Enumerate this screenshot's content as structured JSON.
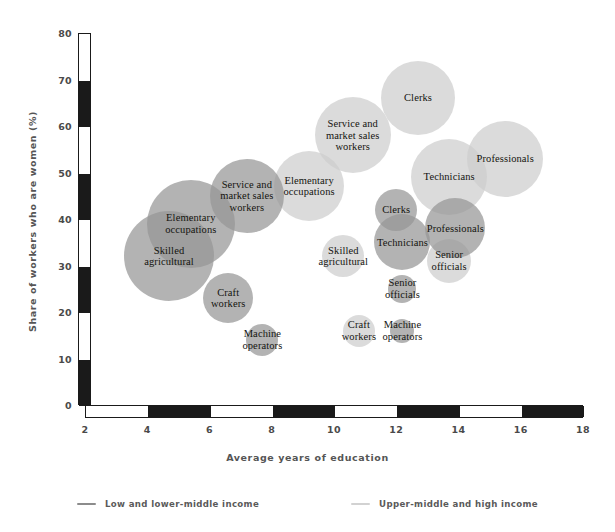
{
  "chart_data": {
    "type": "scatter",
    "title": "",
    "xlabel": "Average years of education",
    "ylabel": "Share of workers who are women (%)",
    "xlim": [
      2,
      18
    ],
    "ylim": [
      0,
      80
    ],
    "xticks": [
      2,
      4,
      6,
      8,
      10,
      12,
      14,
      16,
      18
    ],
    "yticks": [
      0,
      10,
      20,
      30,
      40,
      50,
      60,
      70,
      80
    ],
    "grid": false,
    "legend_position": "bottom-center",
    "axis_style": "alternating black and white banded bars",
    "series": [
      {
        "name": "Low and lower-middle income",
        "color": "#969696",
        "points": [
          {
            "label": "Skilled\nagricultural",
            "x": 4.7,
            "y": 32,
            "size": 45
          },
          {
            "label": "Elementary\noccupations",
            "x": 5.4,
            "y": 39,
            "size": 44
          },
          {
            "label": "Service and\nmarket sales\nworkers",
            "x": 7.2,
            "y": 45,
            "size": 37
          },
          {
            "label": "Craft\nworkers",
            "x": 6.6,
            "y": 23,
            "size": 25
          },
          {
            "label": "Machine\noperators",
            "x": 7.7,
            "y": 14,
            "size": 16
          },
          {
            "label": "Clerks",
            "x": 12.0,
            "y": 42,
            "size": 21
          },
          {
            "label": "Technicians",
            "x": 12.2,
            "y": 35,
            "size": 28
          },
          {
            "label": "Professionals",
            "x": 13.9,
            "y": 38,
            "size": 30
          },
          {
            "label": "Senior\nofficials",
            "x": 12.2,
            "y": 25,
            "size": 14
          },
          {
            "label": "Machine\noperators",
            "x": 12.2,
            "y": 16,
            "size": 12
          }
        ]
      },
      {
        "name": "Upper-middle and high income",
        "color": "#cdcdcd",
        "points": [
          {
            "label": "Elementary\noccupations",
            "x": 9.2,
            "y": 47,
            "size": 35
          },
          {
            "label": "Service and\nmarket sales\nworkers",
            "x": 10.6,
            "y": 58,
            "size": 38
          },
          {
            "label": "Clerks",
            "x": 12.7,
            "y": 66,
            "size": 37
          },
          {
            "label": "Technicians",
            "x": 13.7,
            "y": 49,
            "size": 38
          },
          {
            "label": "Professionals",
            "x": 15.5,
            "y": 53,
            "size": 38
          },
          {
            "label": "Skilled\nagricultural",
            "x": 10.3,
            "y": 32,
            "size": 21
          },
          {
            "label": "Senior\nofficials",
            "x": 13.7,
            "y": 31,
            "size": 22
          },
          {
            "label": "Craft\nworkers",
            "x": 10.8,
            "y": 16,
            "size": 16
          }
        ]
      }
    ]
  },
  "axis": {
    "y_label": "Share of workers who are women (%)",
    "x_label": "Average years of education",
    "y_ticks": [
      "80",
      "70",
      "60",
      "50",
      "40",
      "30",
      "20",
      "10",
      "0"
    ],
    "x_ticks": [
      "2",
      "4",
      "6",
      "8",
      "10",
      "12",
      "14",
      "16",
      "18"
    ]
  },
  "legend": {
    "items": [
      {
        "label": "Low and lower-middle income",
        "color": "#8c8c8c"
      },
      {
        "label": "Upper-middle and high income",
        "color": "#d2d2d2"
      }
    ]
  }
}
